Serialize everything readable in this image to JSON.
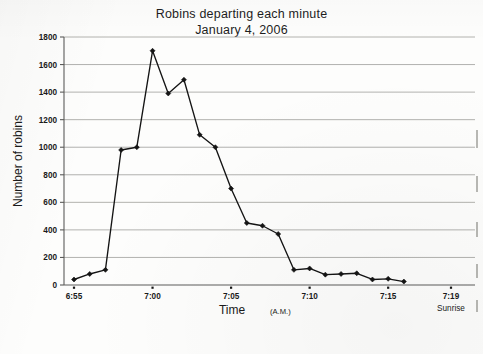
{
  "figure": {
    "title_line_1": "Robins departing each minute",
    "title_line_2": "January 4, 2006",
    "y_axis_title": "Number of robins",
    "x_axis_title": "Time",
    "x_axis_title_suffix": "(A.M.)",
    "sunrise_note": "Sunrise",
    "ink_color": "#141414",
    "grid_color": "#a9a9a6",
    "axis_color": "#5c5c5a"
  },
  "chart_data": {
    "type": "line",
    "title": "Robins departing each minute January 4, 2006",
    "xlabel": "Time (A.M.)",
    "ylabel": "Number of robins",
    "ylim": [
      0,
      1800
    ],
    "ytick_step": 200,
    "yticks": [
      0,
      200,
      400,
      600,
      800,
      1000,
      1200,
      1400,
      1600,
      1800
    ],
    "ytick_labels": [
      "0",
      "200",
      "400",
      "600",
      "800",
      "1000",
      "1200",
      "1400",
      "1600",
      "1800"
    ],
    "xlim_minutes": [
      415,
      439
    ],
    "xticks": [
      "6:55",
      "7:00",
      "7:05",
      "7:10",
      "7:15",
      "7:19"
    ],
    "xtick_minutes": [
      415,
      420,
      425,
      430,
      435,
      439
    ],
    "annotations": [
      {
        "x": "7:19",
        "text": "Sunrise"
      }
    ],
    "grid": "horizontal",
    "legend": "none",
    "marker": "diamond",
    "x": [
      "6:55",
      "6:56",
      "6:57",
      "6:58",
      "6:59",
      "7:00",
      "7:01",
      "7:02",
      "7:03",
      "7:04",
      "7:05",
      "7:06",
      "7:07",
      "7:08",
      "7:09",
      "7:10",
      "7:11",
      "7:12",
      "7:13",
      "7:14",
      "7:15",
      "7:16"
    ],
    "x_minutes": [
      415,
      416,
      417,
      418,
      419,
      420,
      421,
      422,
      423,
      424,
      425,
      426,
      427,
      428,
      429,
      430,
      431,
      432,
      433,
      434,
      435,
      436
    ],
    "values": [
      40,
      80,
      110,
      980,
      1000,
      1700,
      1390,
      1490,
      1090,
      1000,
      700,
      450,
      430,
      370,
      110,
      120,
      75,
      80,
      85,
      40,
      45,
      25
    ],
    "series": [
      {
        "name": "Robins departing",
        "values": [
          40,
          80,
          110,
          980,
          1000,
          1700,
          1390,
          1490,
          1090,
          1000,
          700,
          450,
          430,
          370,
          110,
          120,
          75,
          80,
          85,
          40,
          45,
          25
        ]
      }
    ]
  }
}
